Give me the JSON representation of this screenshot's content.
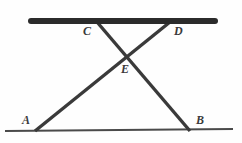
{
  "figure": {
    "background_color": "#fefefe",
    "width": 242,
    "height": 143,
    "colors": {
      "bar": "#2b2b2b",
      "segment": "#3a3a3a",
      "ground_line": "#4a4a4a",
      "label": "#3a3a3a"
    },
    "labels": [
      {
        "id": "C",
        "text": "C",
        "x": 83,
        "y": 25
      },
      {
        "id": "D",
        "text": "D",
        "x": 174,
        "y": 25
      },
      {
        "id": "E",
        "text": "E",
        "x": 121,
        "y": 63
      },
      {
        "id": "A",
        "text": "A",
        "x": 22,
        "y": 114
      },
      {
        "id": "B",
        "text": "B",
        "x": 196,
        "y": 114
      }
    ],
    "points": {
      "A": {
        "x": 35,
        "y": 130
      },
      "B": {
        "x": 190,
        "y": 130
      },
      "C": {
        "x": 97,
        "y": 22
      },
      "D": {
        "x": 170,
        "y": 22
      },
      "E": {
        "x": 128,
        "y": 57
      }
    },
    "shapes": {
      "top_bar": {
        "x1": 31,
        "y1": 21,
        "x2": 215,
        "y2": 21,
        "thickness": 6
      },
      "bottom_line": {
        "x1": 5,
        "y1": 131,
        "x2": 233,
        "y2": 129,
        "thickness": 2
      },
      "segment_CB": {
        "x1": 97,
        "y1": 22,
        "x2": 190,
        "y2": 131,
        "thickness": 3.4
      },
      "segment_DA": {
        "x1": 170,
        "y1": 22,
        "x2": 35,
        "y2": 131,
        "thickness": 3.4
      }
    }
  }
}
